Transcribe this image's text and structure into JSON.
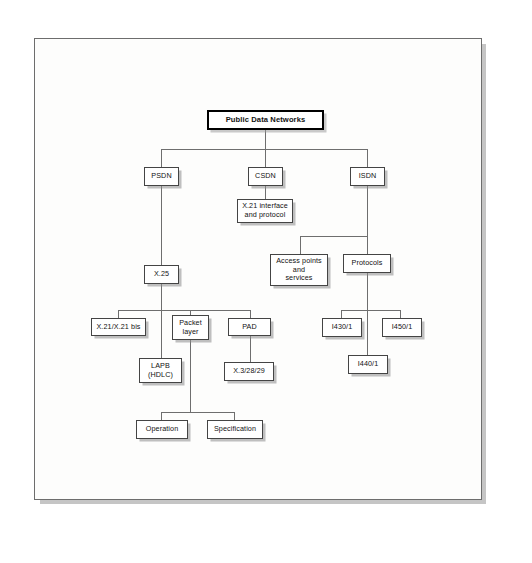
{
  "figure": {
    "kind": "hierarchy-tree-diagram",
    "subject": "Public Data Networks",
    "page_background": "#ffffff",
    "sheet_background": "#fdfdfc",
    "box_border_color": "#444444",
    "root_border_color": "#000000",
    "connector_color": "#6e6e6e",
    "shadow_color": "#8c8c8c"
  },
  "nodes": {
    "root": {
      "label": "Public Data Networks"
    },
    "psdn": {
      "label": "PSDN"
    },
    "csdn": {
      "label": "CSDN"
    },
    "isdn": {
      "label": "ISDN"
    },
    "x21_interface": {
      "label": "X.21 interface\nand protocol"
    },
    "x25": {
      "label": "X.25"
    },
    "access_points": {
      "label": "Access points\nand\nservices"
    },
    "protocols": {
      "label": "Protocols"
    },
    "x21_bis": {
      "label": "X.21/X.21 bis"
    },
    "packet_layer": {
      "label": "Packet\nlayer"
    },
    "pad": {
      "label": "PAD"
    },
    "lapb": {
      "label": "LAPB\n(HDLC)"
    },
    "x3_28_29": {
      "label": "X.3/28/29"
    },
    "i430": {
      "label": "I430/1"
    },
    "i450": {
      "label": "I450/1"
    },
    "i440": {
      "label": "I440/1"
    },
    "operation": {
      "label": "Operation"
    },
    "specification": {
      "label": "Specification"
    }
  },
  "tree": {
    "label": "Public Data Networks",
    "children": [
      {
        "label": "PSDN",
        "children": [
          {
            "label": "X.25",
            "children": [
              {
                "label": "X.21/X.21 bis",
                "children": []
              },
              {
                "label": "Packet layer",
                "children": [
                  {
                    "label": "Operation",
                    "children": []
                  },
                  {
                    "label": "Specification",
                    "children": []
                  }
                ]
              },
              {
                "label": "PAD",
                "children": [
                  {
                    "label": "X.3/28/29",
                    "children": []
                  }
                ]
              },
              {
                "label": "LAPB (HDLC)",
                "children": []
              }
            ]
          }
        ]
      },
      {
        "label": "CSDN",
        "children": [
          {
            "label": "X.21 interface and protocol",
            "children": []
          }
        ]
      },
      {
        "label": "ISDN",
        "children": [
          {
            "label": "Access points and services",
            "children": []
          },
          {
            "label": "Protocols",
            "children": [
              {
                "label": "I430/1",
                "children": []
              },
              {
                "label": "I450/1",
                "children": []
              },
              {
                "label": "I440/1",
                "children": []
              }
            ]
          }
        ]
      }
    ]
  }
}
